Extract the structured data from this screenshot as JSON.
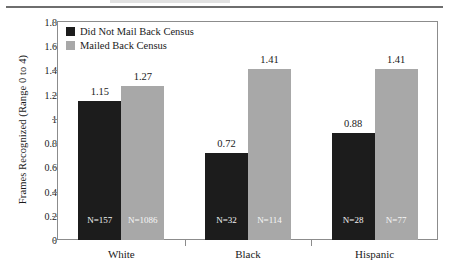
{
  "chart_data": {
    "type": "bar",
    "title": "",
    "xlabel": "",
    "ylabel": "Frames Recognized (Range 0 to 4)",
    "ylim": [
      0,
      1.8
    ],
    "grid": false,
    "legend_position": "top-left",
    "categories": [
      "White",
      "Black",
      "Hispanic"
    ],
    "ytick_labels": [
      "1.8",
      "1.6",
      "1.4",
      "1.2",
      "1",
      "0.8",
      "0.6",
      "0.4",
      "0.2",
      "0"
    ],
    "ytick_values": [
      1.8,
      1.6,
      1.4,
      1.2,
      1.0,
      0.8,
      0.6,
      0.4,
      0.2,
      0
    ],
    "series": [
      {
        "name": "Did Not Mail Back Census",
        "color": "#1c1c1c",
        "values": [
          1.15,
          0.72,
          0.88
        ],
        "value_labels": [
          "1.15",
          "0.72",
          "0.88"
        ],
        "n_labels": [
          "N=157",
          "N=32",
          "N=28"
        ],
        "n_values": [
          157,
          32,
          28
        ]
      },
      {
        "name": "Mailed Back Census",
        "color": "#a8a8a8",
        "values": [
          1.27,
          1.41,
          1.41
        ],
        "value_labels": [
          "1.27",
          "1.41",
          "1.41"
        ],
        "n_labels": [
          "N=1086",
          "N=114",
          "N=77"
        ],
        "n_values": [
          1086,
          114,
          77
        ]
      }
    ]
  },
  "legend": {
    "items": [
      {
        "label": "Did Not Mail Back Census",
        "color": "#1c1c1c"
      },
      {
        "label": "Mailed Back Census",
        "color": "#a8a8a8"
      }
    ]
  },
  "axes": {
    "y_title": "Frames Recognized (Range 0 to 4)",
    "y_ticks": [
      "1.8",
      "1.6",
      "1.4",
      "1.2",
      "1",
      "0.8",
      "0.6",
      "0.4",
      "0.2",
      "0"
    ],
    "x_categories": [
      "White",
      "Black",
      "Hispanic"
    ]
  },
  "colors": {
    "dark_bar": "#1c1c1c",
    "gray_bar": "#a8a8a8",
    "frame": "#8c8c8c",
    "text": "#1a1a1a",
    "background": "#ffffff"
  }
}
